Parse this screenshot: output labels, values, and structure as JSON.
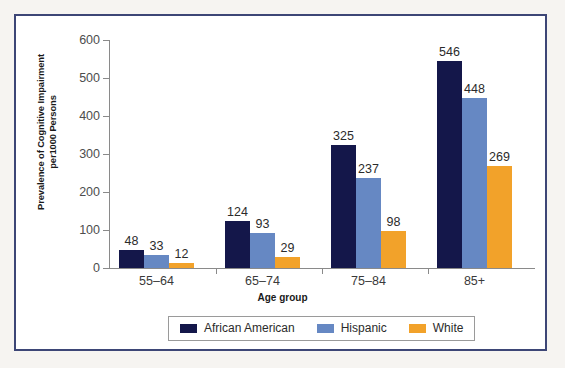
{
  "chart_data": {
    "type": "bar",
    "title": "",
    "xlabel": "Age group",
    "ylabel": "Prevalence of Cognitive Impairment per1000 Persons",
    "ylabel_lines": [
      "Prevalence of Cognitive Impairment",
      "per1000 Persons"
    ],
    "categories": [
      "55–64",
      "65–74",
      "75–84",
      "85+"
    ],
    "series": [
      {
        "name": "African American",
        "color": "#14174a",
        "values": [
          48,
          124,
          325,
          546
        ]
      },
      {
        "name": "Hispanic",
        "color": "#6688c3",
        "values": [
          33,
          93,
          237,
          448
        ]
      },
      {
        "name": "White",
        "color": "#f2a22a",
        "values": [
          12,
          29,
          98,
          269
        ]
      }
    ],
    "ylim": [
      0,
      600
    ],
    "yticks": [
      0,
      100,
      200,
      300,
      400,
      500,
      600
    ],
    "ytick_labels": [
      "0",
      "100",
      "200",
      "300",
      "400",
      "500",
      "600"
    ],
    "grid": false,
    "legend_position": "bottom",
    "data_labels": true
  },
  "frame": {
    "border_color": "#3d4676",
    "background": "#ffffff",
    "page_background": "#f6f4f1"
  }
}
